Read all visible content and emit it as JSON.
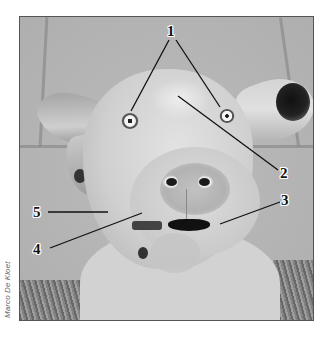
{
  "photo": {
    "subject": "dog-face",
    "style": "grayscale"
  },
  "credit": "Marco De Kloet",
  "labels": [
    {
      "id": "1",
      "text": "1",
      "x": 167,
      "y": 24
    },
    {
      "id": "2",
      "text": "2",
      "x": 280,
      "y": 166
    },
    {
      "id": "3",
      "text": "3",
      "x": 281,
      "y": 193
    },
    {
      "id": "4",
      "text": "4",
      "x": 33,
      "y": 242
    },
    {
      "id": "5",
      "text": "5",
      "x": 33,
      "y": 205
    }
  ],
  "colors": {
    "label_text": "#111111",
    "leader_line": "#111111",
    "background": "#ffffff",
    "credit_text": "#666666"
  }
}
